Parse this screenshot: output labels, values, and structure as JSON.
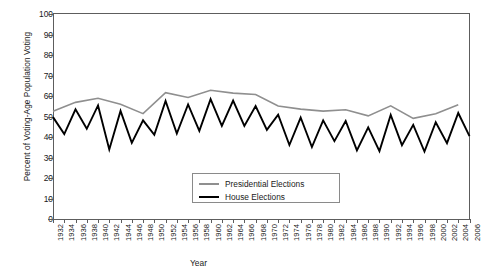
{
  "chart_data": {
    "type": "line",
    "title": "",
    "xlabel": "Year",
    "ylabel": "Percent of Voting-Age Population Voting",
    "ylim": [
      0,
      100
    ],
    "ytick_step": 10,
    "yticks": [
      100,
      90,
      80,
      70,
      60,
      50,
      40,
      30,
      20,
      10,
      0
    ],
    "xlim": [
      1932,
      2006
    ],
    "grid": false,
    "legend_position": "inside-bottom-center",
    "x": [
      1932,
      1934,
      1936,
      1938,
      1940,
      1942,
      1944,
      1946,
      1948,
      1950,
      1952,
      1954,
      1956,
      1958,
      1960,
      1962,
      1964,
      1966,
      1968,
      1970,
      1972,
      1974,
      1976,
      1978,
      1980,
      1982,
      1984,
      1986,
      1988,
      1990,
      1992,
      1994,
      1996,
      1998,
      2000,
      2002,
      2004,
      2006
    ],
    "series": [
      {
        "name": "Presidential Elections",
        "color": "#8f8f8f",
        "x": [
          1932,
          1936,
          1940,
          1944,
          1948,
          1952,
          1956,
          1960,
          1964,
          1968,
          1972,
          1976,
          1980,
          1984,
          1988,
          1992,
          1996,
          2000,
          2004
        ],
        "values": [
          52.6,
          56.9,
          58.9,
          56.0,
          51.4,
          61.6,
          59.3,
          62.8,
          61.4,
          60.7,
          55.1,
          53.6,
          52.6,
          53.3,
          50.3,
          55.2,
          49.1,
          51.3,
          55.7
        ]
      },
      {
        "name": "House Elections",
        "color": "#000000",
        "x": [
          1932,
          1934,
          1936,
          1938,
          1940,
          1942,
          1944,
          1946,
          1948,
          1950,
          1952,
          1954,
          1956,
          1958,
          1960,
          1962,
          1964,
          1966,
          1968,
          1970,
          1972,
          1974,
          1976,
          1978,
          1980,
          1982,
          1984,
          1986,
          1988,
          1990,
          1992,
          1994,
          1996,
          1998,
          2000,
          2002,
          2004,
          2006
        ],
        "values": [
          49.7,
          41.4,
          53.5,
          44.0,
          55.4,
          33.9,
          52.7,
          37.1,
          48.1,
          41.1,
          57.6,
          41.7,
          55.9,
          43.0,
          58.5,
          45.4,
          57.8,
          45.4,
          55.1,
          43.5,
          50.9,
          36.1,
          49.5,
          35.1,
          48.1,
          38.0,
          47.8,
          33.5,
          44.7,
          33.1,
          50.8,
          36.0,
          45.9,
          32.9,
          47.2,
          37.0,
          51.7,
          40.4
        ]
      }
    ],
    "legend": [
      {
        "label": "Presidential Elections",
        "color": "#8f8f8f"
      },
      {
        "label": "House Elections",
        "color": "#000000"
      }
    ]
  },
  "caption": ""
}
